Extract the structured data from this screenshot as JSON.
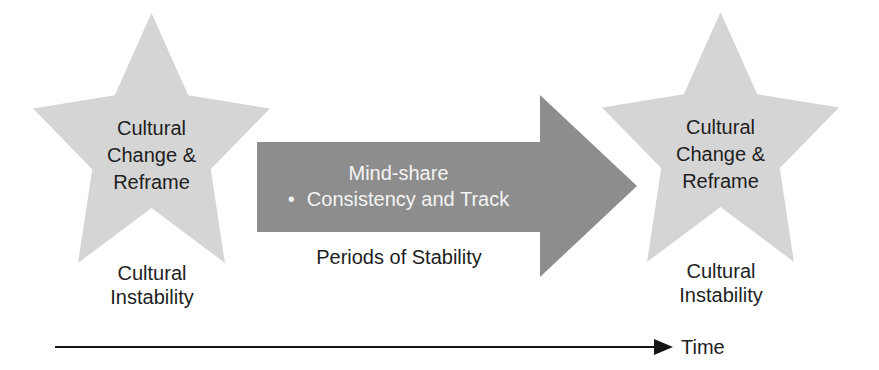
{
  "diagram": {
    "left_star": {
      "line1": "Cultural",
      "line2": "Change &",
      "line3": "Reframe",
      "caption_line1": "Cultural",
      "caption_line2": "Instability"
    },
    "right_star": {
      "line1": "Cultural",
      "line2": "Change &",
      "line3": "Reframe",
      "caption_line1": "Cultural",
      "caption_line2": "Instability"
    },
    "stability_arrow": {
      "line1": "Mind-share",
      "bullet": "•",
      "line2": "Consistency and Track",
      "caption": "Periods of Stability"
    },
    "timeline": {
      "label": "Time"
    },
    "colors": {
      "background": "#ffffff",
      "star_fill": "#d5d5d5",
      "arrow_fill": "#8d8d8d",
      "arrow_text": "#f4f4f4",
      "text": "#1e1e1e",
      "timeline": "#161616"
    }
  }
}
